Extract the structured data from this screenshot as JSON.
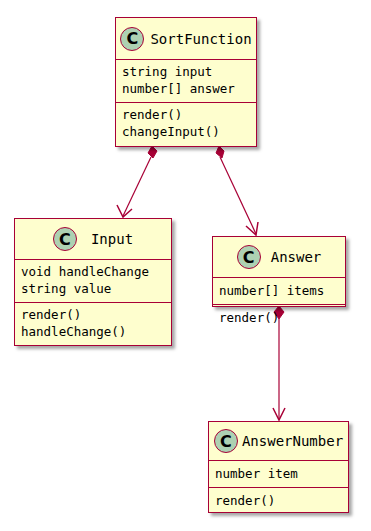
{
  "diagram": {
    "type": "uml-class-diagram",
    "classes": {
      "sortFunction": {
        "stereotype_icon": "C",
        "name": "SortFunction",
        "fields": [
          "string input",
          "number[] answer"
        ],
        "methods": [
          "render()",
          "changeInput()"
        ]
      },
      "input": {
        "stereotype_icon": "C",
        "name": "Input",
        "fields": [
          "void handleChange",
          "string value"
        ],
        "methods": [
          "render()",
          "handleChange()"
        ]
      },
      "answer": {
        "stereotype_icon": "C",
        "name": "Answer",
        "fields": [
          "number[] items"
        ],
        "methods": [
          "render()"
        ]
      },
      "answerNumber": {
        "stereotype_icon": "C",
        "name": "AnswerNumber",
        "fields": [
          "number item"
        ],
        "methods": [
          "render()"
        ]
      }
    },
    "relations": [
      {
        "from": "SortFunction",
        "to": "Input",
        "type": "composition"
      },
      {
        "from": "SortFunction",
        "to": "Answer",
        "type": "composition"
      },
      {
        "from": "Answer",
        "to": "AnswerNumber",
        "type": "composition"
      }
    ],
    "colors": {
      "class_fill": "#fefece",
      "border": "#a80036",
      "icon_fill": "#add1b2"
    }
  }
}
